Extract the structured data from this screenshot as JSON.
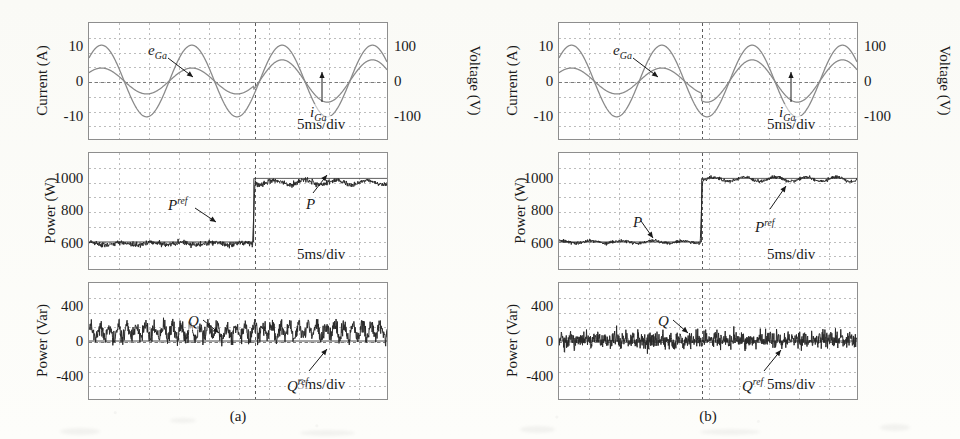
{
  "figure": {
    "panels": [
      {
        "id": "a",
        "caption": "(a)",
        "subplots": [
          {
            "id": "a-top",
            "ylabel": "Current (A)",
            "ylabel_right": "Voltage (V)",
            "yticks": [
              10,
              0,
              -10
            ],
            "ytick_labels": [
              "10",
              "0",
              "-10"
            ],
            "yticks_right": [
              100,
              0,
              -100
            ],
            "ytick_labels_right": [
              "100",
              "0",
              "-100"
            ],
            "ylim": [
              -17,
              17
            ],
            "ylim_right": [
              -170,
              170
            ],
            "timebase": "5ms/div",
            "traces": [
              {
                "name": "e_Ga",
                "label": "e",
                "sub": "Ga",
                "kind": "sine",
                "amplitude_pre": 10.5,
                "amplitude_post": 10.5,
                "cycles": 3.3,
                "phase_deg": 40,
                "color": "#8a8a8a",
                "width": 1.3
              },
              {
                "name": "i_Ga",
                "label": "i",
                "sub": "Ga",
                "kind": "sine",
                "amplitude_pre": 3.8,
                "amplitude_post": 6.2,
                "cycles": 3.3,
                "phase_deg": 40,
                "color": "#8a8a8a",
                "width": 1.3
              }
            ]
          },
          {
            "id": "a-mid",
            "ylabel": "Power (W)",
            "yticks": [
              1000,
              800,
              600
            ],
            "ytick_labels": [
              "1000",
              "800",
              "600"
            ],
            "ylim": [
              430,
              1160
            ],
            "timebase": "5ms/div",
            "traces": [
              {
                "name": "P",
                "label": "P",
                "sup": "",
                "kind": "step-noisy",
                "level_pre": 590,
                "level_post": 975,
                "noise": 17,
                "color": "#2a2a2a",
                "width": 1.0
              },
              {
                "name": "P_ref",
                "label": "P",
                "sup": "ref",
                "kind": "step-clean",
                "level_pre": 600,
                "level_post": 1000,
                "noise": 0,
                "color": "#2a2a2a",
                "width": 1.0
              }
            ]
          },
          {
            "id": "a-bot",
            "ylabel": "Power (Var)",
            "yticks": [
              400,
              0,
              -400
            ],
            "ytick_labels": [
              "400",
              "0",
              "-400"
            ],
            "ylim": [
              -680,
              680
            ],
            "timebase": "5ms/div",
            "traces": [
              {
                "name": "Q",
                "label": "Q",
                "sup": "",
                "kind": "ripple-noisy",
                "level_pre": 105,
                "level_post": 120,
                "noise": 95,
                "ripple": 70,
                "color": "#2a2a2a",
                "width": 1.0
              },
              {
                "name": "Q_ref",
                "label": "Q",
                "sup": "ref",
                "kind": "flat",
                "level_pre": 0,
                "level_post": 0,
                "noise": 0,
                "color": "#2a2a2a",
                "width": 1.0
              }
            ]
          }
        ]
      },
      {
        "id": "b",
        "caption": "(b)",
        "subplots": [
          {
            "id": "b-top",
            "ylabel": "Current (A)",
            "ylabel_right": "Voltage (V)",
            "yticks": [
              10,
              0,
              -10
            ],
            "ytick_labels": [
              "10",
              "0",
              "-10"
            ],
            "yticks_right": [
              100,
              0,
              -100
            ],
            "ytick_labels_right": [
              "100",
              "0",
              "-100"
            ],
            "ylim": [
              -17,
              17
            ],
            "ylim_right": [
              -170,
              170
            ],
            "timebase": "5ms/div",
            "traces": [
              {
                "name": "e_Ga",
                "label": "e",
                "sub": "Ga",
                "kind": "sine",
                "amplitude_pre": 10.5,
                "amplitude_post": 10.5,
                "cycles": 3.3,
                "phase_deg": 40,
                "color": "#8a8a8a",
                "width": 1.3
              },
              {
                "name": "i_Ga",
                "label": "i",
                "sub": "Ga",
                "kind": "sine",
                "amplitude_pre": 3.8,
                "amplitude_post": 6.2,
                "cycles": 3.3,
                "phase_deg": 40,
                "color": "#8a8a8a",
                "width": 1.3
              }
            ]
          },
          {
            "id": "b-mid",
            "ylabel": "Power (W)",
            "yticks": [
              1000,
              800,
              600
            ],
            "ytick_labels": [
              "1000",
              "800",
              "600"
            ],
            "ylim": [
              430,
              1160
            ],
            "timebase": "5ms/div",
            "traces": [
              {
                "name": "P",
                "label": "P",
                "sup": "",
                "kind": "step-noisy",
                "level_pre": 600,
                "level_post": 995,
                "noise": 11,
                "color": "#2a2a2a",
                "width": 1.0
              },
              {
                "name": "P_ref",
                "label": "P",
                "sup": "ref",
                "kind": "step-clean",
                "level_pre": 600,
                "level_post": 1000,
                "noise": 0,
                "color": "#2a2a2a",
                "width": 1.0
              }
            ]
          },
          {
            "id": "b-bot",
            "ylabel": "Power (Var)",
            "yticks": [
              400,
              0,
              -400
            ],
            "ytick_labels": [
              "400",
              "0",
              "-400"
            ],
            "ylim": [
              -680,
              680
            ],
            "timebase": "5ms/div",
            "traces": [
              {
                "name": "Q",
                "label": "Q",
                "sup": "",
                "kind": "ripple-noisy",
                "level_pre": 10,
                "level_post": 15,
                "noise": 105,
                "ripple": 18,
                "color": "#2a2a2a",
                "width": 1.0
              },
              {
                "name": "Q_ref",
                "label": "Q",
                "sup": "ref",
                "kind": "flat",
                "level_pre": 0,
                "level_post": 0,
                "noise": 0,
                "color": "#2a2a2a",
                "width": 1.0
              }
            ]
          }
        ]
      }
    ]
  },
  "annotations": {
    "a": {
      "top": [
        {
          "name": "ega",
          "text_html": "e<sub>Ga</sub>",
          "x": 148,
          "y": 42,
          "lx1": 168,
          "ly1": 58,
          "lx2": 193,
          "ly2": 77
        },
        {
          "name": "iga",
          "text_html": "i<sub>Ga</sub>",
          "x": 310,
          "y": 104,
          "lx1": 322,
          "ly1": 102,
          "lx2": 322,
          "ly2": 72
        }
      ],
      "mid": [
        {
          "name": "pref",
          "text_html": "P<sup>ref</sup>",
          "x": 168,
          "y": 196,
          "lx1": 195,
          "ly1": 208,
          "lx2": 216,
          "ly2": 222
        },
        {
          "name": "p",
          "text_html": "P",
          "x": 306,
          "y": 196,
          "lx1": 313,
          "ly1": 193,
          "lx2": 327,
          "ly2": 175
        }
      ],
      "bot": [
        {
          "name": "q",
          "text_html": "Q",
          "x": 188,
          "y": 313,
          "lx1": 203,
          "ly1": 320,
          "lx2": 219,
          "ly2": 333
        },
        {
          "name": "qref",
          "text_html": "Q<sup>ref</sup>",
          "x": 287,
          "y": 377,
          "lx1": 309,
          "ly1": 371,
          "lx2": 327,
          "ly2": 349
        }
      ]
    },
    "b": {
      "top": [
        {
          "name": "ega",
          "text_html": "e<sub>Ga</sub>",
          "x": 613,
          "y": 42,
          "lx1": 633,
          "ly1": 58,
          "lx2": 658,
          "ly2": 77
        },
        {
          "name": "iga",
          "text_html": "i<sub>Ga</sub>",
          "x": 779,
          "y": 104,
          "lx1": 791,
          "ly1": 102,
          "lx2": 791,
          "ly2": 72
        }
      ],
      "mid": [
        {
          "name": "p",
          "text_html": "P",
          "x": 633,
          "y": 214,
          "lx1": 641,
          "ly1": 221,
          "lx2": 653,
          "ly2": 238
        },
        {
          "name": "pref",
          "text_html": "P<sup>ref</sup>",
          "x": 755,
          "y": 218,
          "lx1": 770,
          "ly1": 209,
          "lx2": 786,
          "ly2": 186
        }
      ],
      "bot": [
        {
          "name": "q",
          "text_html": "Q",
          "x": 658,
          "y": 313,
          "lx1": 673,
          "ly1": 320,
          "lx2": 688,
          "ly2": 333
        },
        {
          "name": "qref",
          "text_html": "Q<sup>ref</sup>",
          "x": 742,
          "y": 377,
          "lx1": 764,
          "ly1": 371,
          "lx2": 781,
          "ly2": 350
        }
      ]
    }
  },
  "layout": {
    "panel_a": {
      "plot_left": 88,
      "plot_right": 388,
      "trigger_frac": 0.553
    },
    "panel_b": {
      "plot_left": 558,
      "plot_right": 858,
      "trigger_frac": 0.478
    },
    "rows": [
      {
        "id": "top",
        "top": 22,
        "height": 118
      },
      {
        "id": "mid",
        "top": 152,
        "height": 118
      },
      {
        "id": "bot",
        "top": 282,
        "height": 118
      }
    ],
    "grid_cols": 10,
    "grid_rows": 8
  }
}
